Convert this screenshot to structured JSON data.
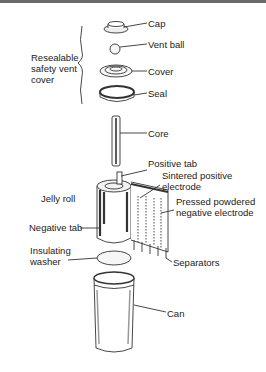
{
  "group_label": "Resealable\nsafety vent\ncover",
  "parts": {
    "cap": "Cap",
    "vent_ball": "Vent ball",
    "cover": "Cover",
    "seal": "Seal",
    "core": "Core",
    "positive_tab": "Positive tab",
    "sintered_positive_electrode": "Sintered positive\nelectrode",
    "jelly_roll": "Jelly roll",
    "pressed_negative_electrode": "Pressed powdered\nnegative electrode",
    "negative_tab": "Negative tab",
    "insulating_washer": "Insulating\nwasher",
    "separators": "Separators",
    "can": "Can"
  },
  "colors": {
    "line": "#333333",
    "border": "#6a6a6a"
  }
}
